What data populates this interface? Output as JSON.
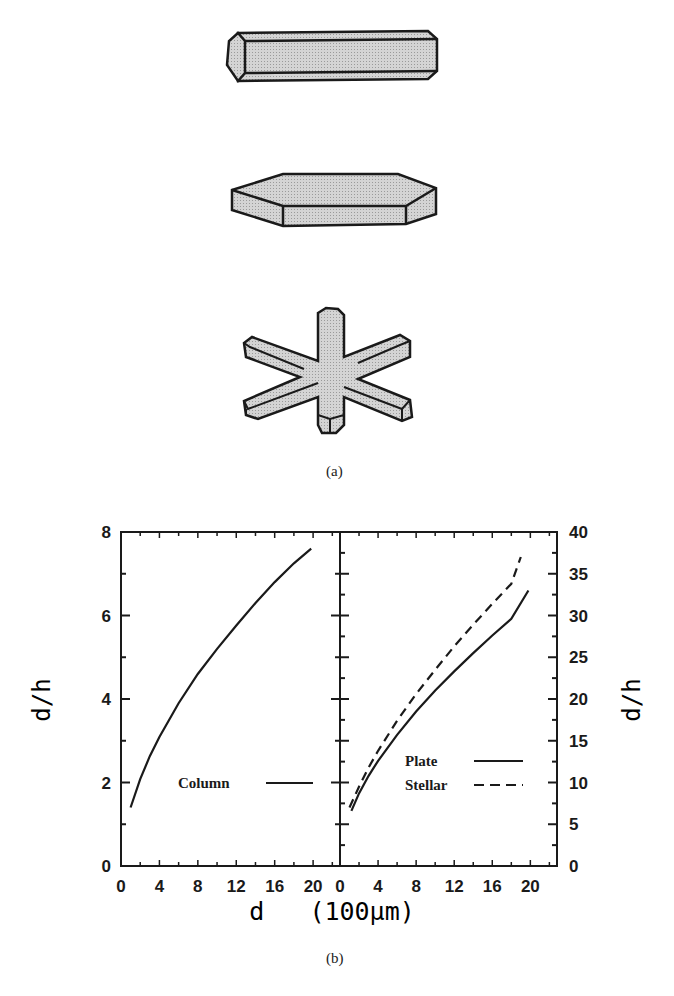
{
  "figure": {
    "part_a": {
      "label": "(a)",
      "crystals": [
        {
          "name": "column",
          "description": "hexagonal column"
        },
        {
          "name": "plate",
          "description": "hexagonal plate"
        },
        {
          "name": "stellar",
          "description": "six-armed stellar crystal"
        }
      ],
      "fill_color": "#cfcfcf",
      "stroke_color": "#1a1a1a"
    },
    "part_b": {
      "label": "(b)",
      "xlabel": "d   (100μm)",
      "left_ylabel": "d/h",
      "right_ylabel": "d/h"
    }
  },
  "chart_data": [
    {
      "type": "line",
      "panel": "left",
      "title": "",
      "xlabel": "d (100μm)",
      "ylabel": "d/h",
      "xlim": [
        0,
        22.8
      ],
      "ylim": [
        0,
        8
      ],
      "xticks": [
        0,
        4,
        8,
        12,
        16,
        20
      ],
      "yticks": [
        0,
        2,
        4,
        6,
        8
      ],
      "grid": false,
      "legend_position": "lower right",
      "series": [
        {
          "name": "Column",
          "style": "solid",
          "x": [
            1,
            2,
            3,
            4,
            6,
            8,
            10,
            12,
            14,
            16,
            18,
            19.8
          ],
          "y": [
            1.4,
            2.08,
            2.63,
            3.09,
            3.9,
            4.6,
            5.2,
            5.76,
            6.3,
            6.8,
            7.25,
            7.6
          ]
        }
      ]
    },
    {
      "type": "line",
      "panel": "right",
      "title": "",
      "xlabel": "d (100μm)",
      "ylabel": "d/h",
      "xlim": [
        0,
        22.8
      ],
      "ylim": [
        0,
        40
      ],
      "xticks": [
        0,
        4,
        8,
        12,
        16,
        20
      ],
      "yticks": [
        0,
        5,
        10,
        15,
        20,
        25,
        30,
        35,
        40
      ],
      "grid": false,
      "legend_position": "lower right",
      "series": [
        {
          "name": "Plate",
          "style": "solid",
          "x": [
            1.2,
            2,
            3,
            4,
            6,
            8,
            10,
            12,
            14,
            16,
            18,
            19.8
          ],
          "y": [
            6.6,
            8.7,
            10.8,
            12.6,
            15.7,
            18.5,
            21.0,
            23.3,
            25.5,
            27.6,
            29.6,
            33.0
          ]
        },
        {
          "name": "Stellar",
          "style": "dashed",
          "x": [
            1.0,
            2,
            3,
            4,
            6,
            8,
            10,
            12,
            14,
            16,
            18,
            19.0
          ],
          "y": [
            7.0,
            9.5,
            11.8,
            13.8,
            17.4,
            20.6,
            23.5,
            26.3,
            28.9,
            31.4,
            33.8,
            37.0
          ]
        }
      ]
    }
  ]
}
